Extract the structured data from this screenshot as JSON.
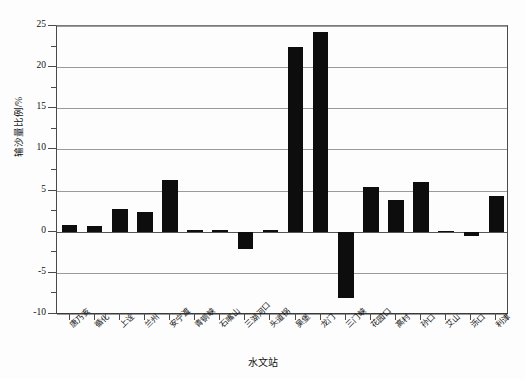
{
  "chart_data": {
    "type": "bar",
    "title": "",
    "xlabel": "水文站",
    "ylabel": "输沙量比例/%",
    "ylim": [
      -10,
      25
    ],
    "yticks": [
      25,
      20,
      15,
      10,
      5,
      0,
      -5,
      -10
    ],
    "ytick_labels": [
      "25",
      "20",
      "15",
      "10",
      "5",
      "0",
      "-5",
      "-10"
    ],
    "minor_tick_step": 2.5,
    "grid": true,
    "grid_axis": "y",
    "legend": "none",
    "bar_color": "#0d0d0d",
    "categories": [
      "唐乃亥",
      "循化",
      "上诠",
      "兰州",
      "安宁渡",
      "青铜峡",
      "石嘴山",
      "三湖河口",
      "头道拐",
      "吴堡",
      "龙门",
      "三门峡",
      "花园口",
      "高村",
      "孙口",
      "艾山",
      "泺口",
      "利津"
    ],
    "values": [
      0.8,
      0.7,
      2.7,
      2.4,
      6.3,
      0.2,
      0.2,
      -2.1,
      0.2,
      22.5,
      24.3,
      -8.1,
      5.4,
      3.9,
      6.1,
      0.1,
      -0.5,
      4.4
    ]
  }
}
